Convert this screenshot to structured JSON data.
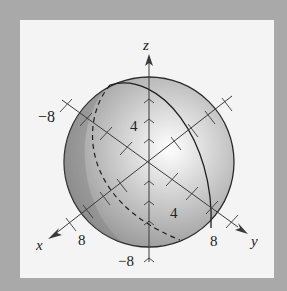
{
  "figure": {
    "axes": {
      "x": {
        "label": "x",
        "ticks": [
          "8"
        ]
      },
      "y": {
        "label": "y",
        "ticks": [
          "8",
          "4"
        ]
      },
      "z": {
        "label": "z",
        "ticks": [
          "4",
          "-8"
        ]
      },
      "neg_label": "−8"
    },
    "labels": {
      "z_axis": "z",
      "x_axis": "x",
      "y_axis": "y",
      "x_neg": "−8",
      "z_4": "4",
      "y_4": "4",
      "x_8": "8",
      "y_8": "8",
      "z_neg": "−8"
    },
    "colors": {
      "background": "#a9a9a9",
      "panel": "#f4f4f4",
      "sphere_light": "#ffffff",
      "sphere_dark": "#8a8a8a",
      "lines": "#3a3a3a"
    }
  }
}
